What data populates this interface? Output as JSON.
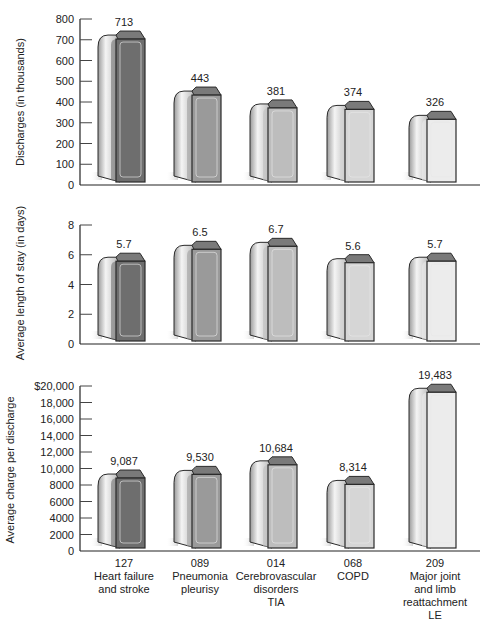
{
  "chart_data": [
    {
      "type": "bar",
      "title": "",
      "xlabel": "",
      "ylabel": "Discharges (in thousands)",
      "categories": [
        "127 Heart failure and stroke",
        "089 Pneumonia pleurisy",
        "014 Cerebrovascular disorders TIA",
        "068 COPD",
        "209 Major joint and limb reattachment LE"
      ],
      "values": [
        713,
        443,
        381,
        374,
        326
      ],
      "value_labels": [
        "713",
        "443",
        "381",
        "374",
        "326"
      ],
      "yticks": [
        "0",
        "100",
        "200",
        "300",
        "400",
        "500",
        "600",
        "700",
        "800"
      ],
      "ylim": [
        0,
        800
      ],
      "grid": false
    },
    {
      "type": "bar",
      "title": "",
      "xlabel": "",
      "ylabel": "Average length of stay (in days)",
      "categories": [
        "127 Heart failure and stroke",
        "089 Pneumonia pleurisy",
        "014 Cerebrovascular disorders TIA",
        "068 COPD",
        "209 Major joint and limb reattachment LE"
      ],
      "values": [
        5.7,
        6.5,
        6.7,
        5.6,
        5.7
      ],
      "value_labels": [
        "5.7",
        "6.5",
        "6.7",
        "5.6",
        "5.7"
      ],
      "yticks": [
        "0",
        "2",
        "4",
        "6",
        "8"
      ],
      "ylim": [
        0,
        8
      ],
      "grid": false
    },
    {
      "type": "bar",
      "title": "",
      "xlabel": "",
      "ylabel": "Average charge per discharge",
      "categories": [
        "127 Heart failure and stroke",
        "089 Pneumonia pleurisy",
        "014 Cerebrovascular disorders TIA",
        "068 COPD",
        "209 Major joint and limb reattachment LE"
      ],
      "values": [
        9087,
        9530,
        10684,
        8314,
        19483
      ],
      "value_labels": [
        "9,087",
        "9,530",
        "10,684",
        "8,314",
        "19,483"
      ],
      "yticks": [
        "0",
        "2000",
        "4000",
        "6000",
        "8000",
        "10,000",
        "12,000",
        "14,000",
        "16,000",
        "18,000",
        "$20,000"
      ],
      "ylim": [
        0,
        20000
      ],
      "grid": false
    }
  ],
  "x_axis": {
    "categories": [
      {
        "code": "127",
        "lines": [
          "Heart failure",
          "and stroke"
        ]
      },
      {
        "code": "089",
        "lines": [
          "Pneumonia",
          "pleurisy"
        ]
      },
      {
        "code": "014",
        "lines": [
          "Cerebrovascular",
          "disorders",
          "TIA"
        ]
      },
      {
        "code": "068",
        "lines": [
          "COPD"
        ]
      },
      {
        "code": "209",
        "lines": [
          "Major joint",
          "and limb",
          "reattachment",
          "LE"
        ]
      }
    ]
  },
  "style": {
    "bar_face_colors": [
      "#6e6e6e",
      "#9a9a9a",
      "#bdbdbd",
      "#d6d6d6",
      "#ececec"
    ],
    "bar_side_colors": [
      "#bcbcbc",
      "#c6c6c6",
      "#cfcfcf",
      "#d8d8d8",
      "#e2e2e2"
    ],
    "outline": "#2a2a2a"
  }
}
